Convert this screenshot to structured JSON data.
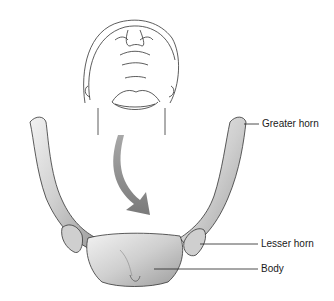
{
  "figure": {
    "labels": [
      {
        "text": "Greater horn",
        "x": 262,
        "y": 118
      },
      {
        "text": "Lesser horn",
        "x": 261,
        "y": 238
      },
      {
        "text": "Body",
        "x": 261,
        "y": 263
      }
    ],
    "arrow_color": "#8a8a8a",
    "bone_color": "#d6d6d6",
    "outline_color": "#333333"
  }
}
